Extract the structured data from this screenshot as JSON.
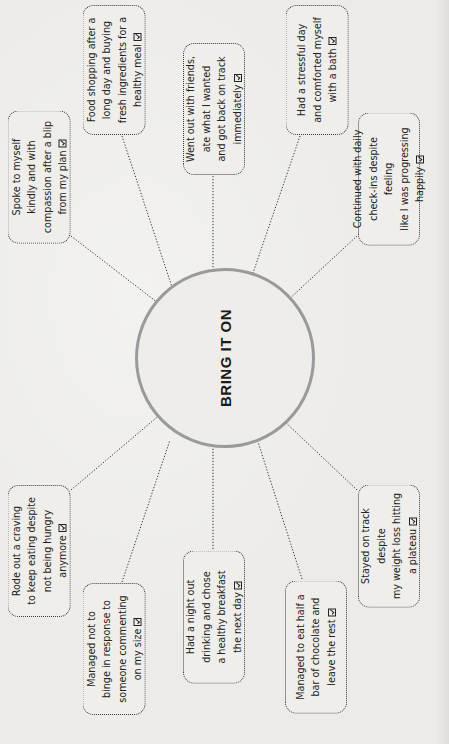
{
  "hub": {
    "title": "BRING IT ON",
    "center": [
      225,
      358
    ],
    "radius": 90,
    "ring_color": "#9a9a9a"
  },
  "boxes": [
    {
      "id": "spoke",
      "lines": [
        "Spoke to myself",
        "kindly and with",
        "compassion after a blip",
        "from my plan"
      ],
      "checked": true
    },
    {
      "id": "food",
      "lines": [
        "Food shopping after a",
        "long day and buying",
        "fresh ingredients for a",
        "healthy meal"
      ],
      "checked": true
    },
    {
      "id": "friends",
      "lines": [
        "Went out with friends,",
        "ate what I wanted",
        "and got back on track",
        "immediately"
      ],
      "checked": true
    },
    {
      "id": "bath",
      "lines": [
        "Had a stressful day",
        "and comforted myself",
        "with a bath"
      ],
      "checked": true
    },
    {
      "id": "checkins",
      "lines": [
        "Continued with daily",
        "check-ins despite feeling",
        "like I was progressing",
        "happily"
      ],
      "checked": true
    },
    {
      "id": "craving",
      "lines": [
        "Rode out a craving",
        "to keep eating despite",
        "not being hungry",
        "anymore"
      ],
      "checked": true
    },
    {
      "id": "binge",
      "lines": [
        "Managed not to",
        "binge in response to",
        "someone commenting",
        "on my size"
      ],
      "checked": true
    },
    {
      "id": "nightout",
      "lines": [
        "Had a night out",
        "drinking and chose",
        "a healthy breakfast",
        "the next day"
      ],
      "checked": true
    },
    {
      "id": "chocolate",
      "lines": [
        "Managed to eat half a",
        "bar of chocolate and",
        "leave the rest"
      ],
      "checked": true
    },
    {
      "id": "plateau",
      "lines": [
        "Stayed on track despite",
        "my weight loss hitting",
        "a plateau"
      ],
      "checked": true
    }
  ],
  "icons": {
    "check": "checked-box-icon"
  }
}
